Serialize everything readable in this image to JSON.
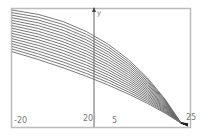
{
  "chart_data": {
    "type": "line",
    "title": "",
    "xlabel": "",
    "ylabel": "y",
    "xlim": [
      -20,
      25
    ],
    "grid": false,
    "legend": "none",
    "tick_labels": {
      "x_left": "-20",
      "y_axis_value": "20",
      "x_mid": "5",
      "x_right": "25"
    },
    "series_count": 17,
    "convergence_point": {
      "x": 23,
      "y": 0
    },
    "series": [
      {
        "name": "c1",
        "start_y_frac": 0.02
      },
      {
        "name": "c2",
        "start_y_frac": 0.04
      },
      {
        "name": "c3",
        "start_y_frac": 0.06
      },
      {
        "name": "c4",
        "start_y_frac": 0.08
      },
      {
        "name": "c5",
        "start_y_frac": 0.1
      },
      {
        "name": "c6",
        "start_y_frac": 0.12
      },
      {
        "name": "c7",
        "start_y_frac": 0.14
      },
      {
        "name": "c8",
        "start_y_frac": 0.16
      },
      {
        "name": "c9",
        "start_y_frac": 0.18
      },
      {
        "name": "c10",
        "start_y_frac": 0.2
      },
      {
        "name": "c11",
        "start_y_frac": 0.22
      },
      {
        "name": "c12",
        "start_y_frac": 0.24
      },
      {
        "name": "c13",
        "start_y_frac": 0.26
      },
      {
        "name": "c14",
        "start_y_frac": 0.28
      },
      {
        "name": "c15",
        "start_y_frac": 0.3
      },
      {
        "name": "c16",
        "start_y_frac": 0.32
      },
      {
        "name": "c17",
        "start_y_frac": 0.34
      }
    ]
  },
  "colors": {
    "frame": "#bbbbbb",
    "axis": "#555555",
    "curve": "#6a6a6a"
  }
}
